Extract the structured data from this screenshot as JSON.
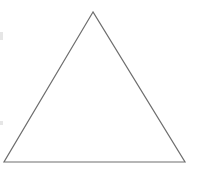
{
  "diagram": {
    "shape": "triangle",
    "stroke_color": "#6e6e6e",
    "fill_color": "#ffffff",
    "background": "#ffffff",
    "stroke_width": 1.2,
    "vertices": {
      "apex": [
        93,
        12
      ],
      "bottom_left": [
        4,
        162
      ],
      "bottom_right": [
        185,
        162
      ]
    }
  }
}
